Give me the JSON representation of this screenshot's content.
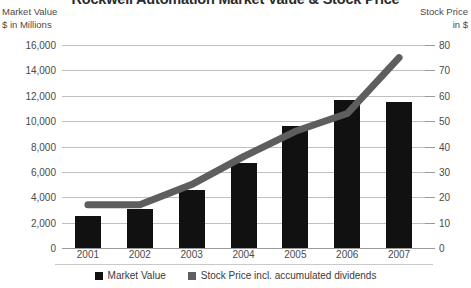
{
  "title": "Rockwell Automation Market Value & Stock Price",
  "axes": {
    "left_caption_line1": "Market Value",
    "left_caption_line2": "$ in Millions",
    "right_caption_line1": "Stock Price",
    "right_caption_line2": "in $"
  },
  "legend": {
    "items": [
      {
        "label": "Market Value",
        "color": "#111111"
      },
      {
        "label": "Stock Price incl. accumulated dividends",
        "color": "#5e5e5e"
      }
    ]
  },
  "chart_data": {
    "type": "bar",
    "title": "Rockwell Automation Market Value & Stock Price",
    "xlabel": "",
    "ylabel": "Market Value $ in Millions",
    "y2label": "Stock Price in $",
    "categories": [
      "2001",
      "2002",
      "2003",
      "2004",
      "2005",
      "2006",
      "2007"
    ],
    "ylim": [
      0,
      16000
    ],
    "y2lim": [
      0,
      80
    ],
    "yticks": [
      "0",
      "2,000",
      "4,000",
      "6,000",
      "8,000",
      "10,000",
      "12,000",
      "14,000",
      "16,000"
    ],
    "ytick_values": [
      0,
      2000,
      4000,
      6000,
      8000,
      10000,
      12000,
      14000,
      16000
    ],
    "y2ticks": [
      "0",
      "10",
      "20",
      "30",
      "40",
      "50",
      "60",
      "70",
      "80"
    ],
    "y2tick_values": [
      0,
      10,
      20,
      30,
      40,
      50,
      60,
      70,
      80
    ],
    "grid": true,
    "legend_position": "bottom",
    "series": [
      {
        "name": "Market Value",
        "type": "bar",
        "axis": "left",
        "color": "#111111",
        "values": [
          2550,
          3050,
          4550,
          6700,
          9600,
          11700,
          11500
        ]
      },
      {
        "name": "Stock Price incl. accumulated dividends",
        "type": "line",
        "axis": "right",
        "color": "#5e5e5e",
        "values": [
          17,
          17,
          25,
          36,
          46,
          53,
          75
        ]
      }
    ]
  }
}
